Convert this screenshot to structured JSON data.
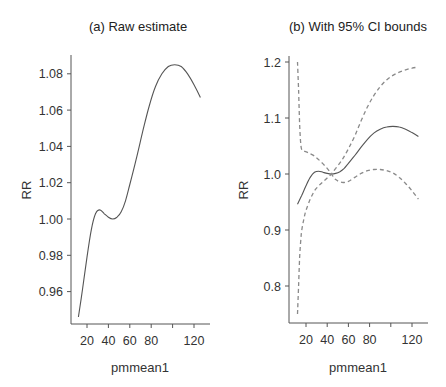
{
  "chart_data": [
    {
      "type": "line",
      "title": "(a) Raw estimate",
      "xlabel": "pmmean1",
      "ylabel": "RR",
      "xlim": [
        10,
        130
      ],
      "ylim": [
        0.944,
        1.09
      ],
      "xticks": [
        20,
        40,
        60,
        80,
        100,
        120
      ],
      "xtick_labels": [
        "20",
        "40",
        "60",
        "80",
        "",
        "120"
      ],
      "yticks": [
        0.96,
        0.98,
        1.0,
        1.02,
        1.04,
        1.06,
        1.08
      ],
      "ytick_labels": [
        "0.96",
        "0.98",
        "1.00",
        "1.02",
        "1.04",
        "1.06",
        "1.08"
      ],
      "grid": false,
      "legend": null,
      "series": [
        {
          "name": "RR estimate",
          "style": "solid",
          "x": [
            12,
            16,
            20,
            24,
            28,
            32,
            36,
            40,
            44,
            48,
            52,
            56,
            60,
            66,
            72,
            78,
            84,
            90,
            96,
            102,
            108,
            114,
            120,
            126
          ],
          "y": [
            0.946,
            0.962,
            0.979,
            0.994,
            1.003,
            1.005,
            1.003,
            1.001,
            1.0,
            1.001,
            1.004,
            1.01,
            1.019,
            1.033,
            1.048,
            1.062,
            1.073,
            1.08,
            1.084,
            1.085,
            1.084,
            1.08,
            1.074,
            1.067
          ]
        }
      ]
    },
    {
      "type": "line",
      "title": "(b) With 95% CI bounds",
      "xlabel": "pmmean1",
      "ylabel": "RR",
      "xlim": [
        10,
        130
      ],
      "ylim": [
        0.73,
        1.22
      ],
      "xticks": [
        20,
        40,
        60,
        80,
        100,
        120
      ],
      "xtick_labels": [
        "20",
        "40",
        "60",
        "80",
        "",
        "120"
      ],
      "yticks": [
        0.8,
        0.9,
        1.0,
        1.1,
        1.2
      ],
      "ytick_labels": [
        "0.8",
        "0.9",
        "1.0",
        "1.1",
        "1.2"
      ],
      "grid": false,
      "legend": null,
      "series": [
        {
          "name": "RR estimate",
          "style": "solid",
          "x": [
            12,
            16,
            20,
            24,
            28,
            32,
            36,
            40,
            44,
            48,
            52,
            56,
            60,
            66,
            72,
            78,
            84,
            90,
            96,
            102,
            108,
            114,
            120,
            126
          ],
          "y": [
            0.946,
            0.962,
            0.979,
            0.994,
            1.003,
            1.005,
            1.003,
            1.001,
            1.0,
            1.001,
            1.004,
            1.01,
            1.019,
            1.033,
            1.048,
            1.062,
            1.073,
            1.08,
            1.084,
            1.085,
            1.084,
            1.08,
            1.074,
            1.067
          ]
        },
        {
          "name": "Upper 95% CI",
          "style": "dashed",
          "x": [
            12,
            13,
            14,
            15,
            16,
            18,
            22,
            28,
            34,
            40,
            44,
            48,
            54,
            60,
            66,
            72,
            78,
            84,
            90,
            96,
            102,
            108,
            114,
            120,
            126
          ],
          "y": [
            1.2,
            1.15,
            1.09,
            1.055,
            1.043,
            1.041,
            1.038,
            1.032,
            1.022,
            1.01,
            1.0,
            0.99,
            0.985,
            0.987,
            0.994,
            1.001,
            1.006,
            1.008,
            1.008,
            1.006,
            1.002,
            0.994,
            0.983,
            0.97,
            0.955
          ]
        },
        {
          "name": "Lower 95% CI",
          "style": "dashed",
          "x": [
            12,
            13,
            14,
            15,
            16,
            18,
            20,
            24,
            28,
            32,
            36,
            40,
            44,
            48,
            54,
            60,
            66,
            72,
            78,
            84,
            90,
            96,
            102,
            108,
            114,
            120,
            126
          ],
          "y": [
            0.75,
            0.8,
            0.85,
            0.88,
            0.9,
            0.92,
            0.935,
            0.955,
            0.97,
            0.979,
            0.986,
            0.993,
            1.0,
            1.01,
            1.025,
            1.045,
            1.068,
            1.095,
            1.12,
            1.14,
            1.156,
            1.168,
            1.176,
            1.182,
            1.186,
            1.189,
            1.191
          ]
        }
      ]
    }
  ],
  "panels": [
    {
      "title": "(a) Raw estimate",
      "xlabel": "pmmean1",
      "ylabel": "RR"
    },
    {
      "title": "(b) With 95% CI bounds",
      "xlabel": "pmmean1",
      "ylabel": "RR"
    }
  ],
  "colors": {
    "axis": "#555555",
    "solid_line": "#555555",
    "dashed_line": "#8a8a8a",
    "text": "#333333"
  }
}
